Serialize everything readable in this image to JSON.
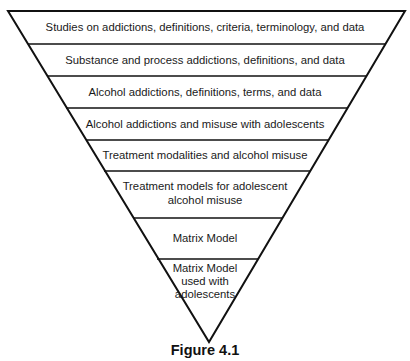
{
  "diagram": {
    "type": "inverted-funnel",
    "levels": [
      {
        "label": "Studies on addictions, definitions, criteria, terminology, and data"
      },
      {
        "label": "Substance and process addictions, definitions, and data"
      },
      {
        "label": "Alcohol addictions, definitions, terms, and data"
      },
      {
        "label": "Alcohol addictions and misuse with adolescents"
      },
      {
        "label": "Treatment modalities and alcohol misuse"
      },
      {
        "label": "Treatment models for adolescent alcohol misuse",
        "lines": [
          "Treatment models for adolescent",
          "alcohol misuse"
        ]
      },
      {
        "label": "Matrix Model"
      },
      {
        "label": "Matrix Model used with adolescents",
        "lines": [
          "Matrix Model",
          "used with",
          "adolescents"
        ]
      }
    ],
    "caption": "Figure 4.1"
  }
}
